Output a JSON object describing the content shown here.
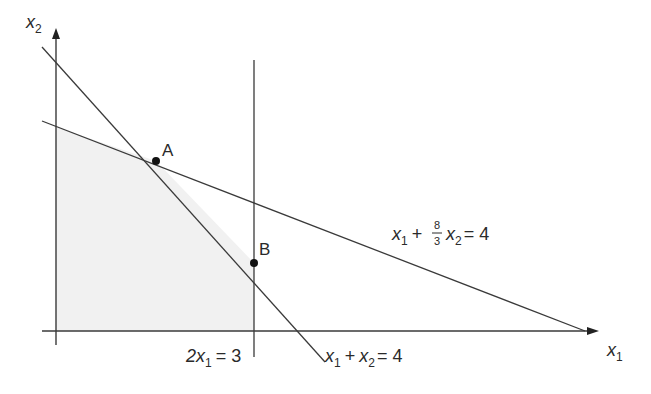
{
  "diagram": {
    "type": "linear-programming-feasible-region",
    "axes": {
      "x_label": "x",
      "x_sub": "1",
      "y_label": "x",
      "y_sub": "2"
    },
    "constraints": [
      {
        "name": "x1 + 8/3 x2 = 4",
        "parts": {
          "a": "x",
          "a_sub": "1",
          "plus": "+",
          "num": "8",
          "den": "3",
          "b": "x",
          "b_sub": "2",
          "eq": "= 4"
        }
      },
      {
        "name": "2x1 = 3",
        "parts": {
          "coef": "2x",
          "sub": "1",
          "eq": "= 3"
        }
      },
      {
        "name": "x1 + x2 = 4",
        "parts": {
          "a": "x",
          "a_sub": "1",
          "plus": "+",
          "b": "x",
          "b_sub": "2",
          "eq": "= 4"
        }
      }
    ],
    "points": [
      {
        "label": "A"
      },
      {
        "label": "B"
      }
    ],
    "colors": {
      "line": "#3a3a3a",
      "shade": "#f2f2f2",
      "point": "#111111"
    }
  }
}
